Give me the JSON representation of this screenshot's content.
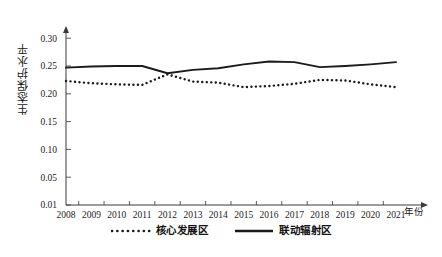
{
  "chart_data": {
    "type": "line",
    "title": "",
    "xlabel": "年份",
    "ylabel": "生态保护水平",
    "grid": false,
    "legend_position": "bottom-center",
    "x": [
      2008,
      2009,
      2010,
      2011,
      2012,
      2013,
      2014,
      2015,
      2016,
      2017,
      2018,
      2019,
      2020,
      2021
    ],
    "categories": [
      "2008",
      "2009",
      "2010",
      "2011",
      "2012",
      "2013",
      "2014",
      "2015",
      "2016",
      "2017",
      "2018",
      "2019",
      "2020",
      "2021"
    ],
    "ylim": [
      0.01,
      0.32
    ],
    "ytick_labels": [
      "0.01",
      "0.05",
      "0.10",
      "0.15",
      "0.20",
      "0.25",
      "0.30"
    ],
    "ytick_values": [
      0.01,
      0.05,
      0.1,
      0.15,
      0.2,
      0.25,
      0.3
    ],
    "series": [
      {
        "name": "核心发展区",
        "style": "dotted",
        "color": "#1b1b1b",
        "values": [
          0.223,
          0.219,
          0.217,
          0.216,
          0.235,
          0.222,
          0.22,
          0.212,
          0.214,
          0.218,
          0.225,
          0.224,
          0.217,
          0.212
        ]
      },
      {
        "name": "联动辐射区",
        "style": "solid",
        "color": "#1b1b1b",
        "values": [
          0.247,
          0.249,
          0.25,
          0.25,
          0.237,
          0.243,
          0.246,
          0.253,
          0.258,
          0.257,
          0.248,
          0.25,
          0.253,
          0.257
        ]
      }
    ]
  },
  "axes": {
    "y_title": "生态保护水平",
    "x_title": "年份"
  },
  "legend": {
    "items": [
      {
        "label": "核心发展区",
        "marker": "dotted-line-swatch"
      },
      {
        "label": "联动辐射区",
        "marker": "solid-line-swatch"
      }
    ]
  }
}
